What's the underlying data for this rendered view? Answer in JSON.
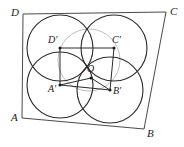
{
  "figure": {
    "type": "geometry-diagram",
    "width": 184,
    "height": 147,
    "colors": {
      "stroke_dark": "#2b2b2b",
      "stroke_light": "#b9b9b9",
      "background": "#ffffff",
      "label": "#1a1a1a"
    }
  },
  "labels": {
    "A": "A",
    "B": "B",
    "C": "C",
    "D": "D",
    "A_prime": "A′",
    "B_prime": "B′",
    "C_prime": "C′",
    "D_prime": "D′",
    "O": "O"
  },
  "label_positions": {
    "A": {
      "x": 11,
      "y": 112
    },
    "B": {
      "x": 147,
      "y": 128
    },
    "C": {
      "x": 170,
      "y": 6
    },
    "D": {
      "x": 11,
      "y": 7
    },
    "A_prime": {
      "x": 48,
      "y": 84
    },
    "B_prime": {
      "x": 113,
      "y": 86
    },
    "C_prime": {
      "x": 112,
      "y": 35
    },
    "D_prime": {
      "x": 48,
      "y": 35
    },
    "O": {
      "x": 87,
      "y": 64
    }
  },
  "outer_quadrilateral": {
    "name": "ABCD",
    "vertices": [
      {
        "id": "A",
        "x": 22,
        "y": 118
      },
      {
        "id": "B",
        "x": 144,
        "y": 129
      },
      {
        "id": "C",
        "x": 166,
        "y": 12
      },
      {
        "id": "D",
        "x": 23,
        "y": 14
      }
    ]
  },
  "inner_quadrilateral": {
    "name": "A′B′C′D′",
    "vertices": [
      {
        "id": "A_prime",
        "x": 60,
        "y": 85
      },
      {
        "id": "B_prime",
        "x": 110,
        "y": 90
      },
      {
        "id": "C_prime",
        "x": 114,
        "y": 48
      },
      {
        "id": "D_prime",
        "x": 60,
        "y": 48
      }
    ]
  },
  "center_point": {
    "id": "O",
    "x": 91,
    "y": 78
  },
  "segments_from_center": [
    {
      "from": "O",
      "to": "B_prime"
    },
    {
      "from": "O",
      "to": "A_prime"
    }
  ],
  "circles": [
    {
      "id": "circle-D-prime",
      "cx": 60,
      "cy": 48,
      "r": 33,
      "tone": "dark"
    },
    {
      "id": "circle-C-prime",
      "cx": 114,
      "cy": 48,
      "r": 33,
      "tone": "dark"
    },
    {
      "id": "circle-A-prime",
      "cx": 60,
      "cy": 85,
      "r": 33,
      "tone": "dark"
    },
    {
      "id": "circle-B-prime",
      "cx": 110,
      "cy": 90,
      "r": 33,
      "tone": "dark"
    },
    {
      "id": "circle-O",
      "cx": 89,
      "cy": 60,
      "r": 31,
      "tone": "light"
    }
  ],
  "point_markers": [
    {
      "id": "A_prime",
      "x": 60,
      "y": 85
    },
    {
      "id": "B_prime",
      "x": 110,
      "y": 90
    },
    {
      "id": "C_prime",
      "x": 114,
      "y": 48
    },
    {
      "id": "D_prime",
      "x": 60,
      "y": 48
    },
    {
      "id": "O",
      "x": 91,
      "y": 78
    }
  ]
}
